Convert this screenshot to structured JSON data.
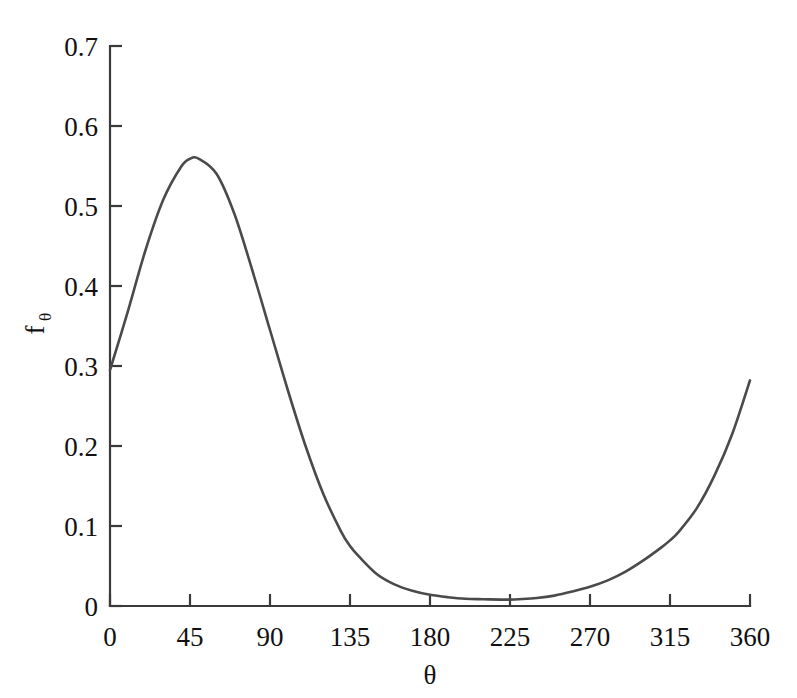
{
  "chart_data": {
    "type": "line",
    "title": "",
    "subtitle": "",
    "xlabel": "θ",
    "ylabel": "f",
    "ylabel_subscript": "θ",
    "xlim": [
      0,
      360
    ],
    "ylim": [
      0,
      0.7
    ],
    "xticks": [
      0,
      45,
      90,
      135,
      180,
      225,
      270,
      315,
      360
    ],
    "xtick_labels": [
      "0",
      "45",
      "90",
      "135",
      "180",
      "225",
      "270",
      "315",
      "360"
    ],
    "yticks": [
      0,
      0.1,
      0.2,
      0.3,
      0.4,
      0.5,
      0.6,
      0.7
    ],
    "ytick_labels": [
      "0",
      "0.1",
      "0.2",
      "0.3",
      "0.4",
      "0.5",
      "0.6",
      "0.7"
    ],
    "grid": false,
    "legend": null,
    "series": [
      {
        "name": "f_theta",
        "color": "#4a4a4a",
        "x": [
          0,
          10,
          20,
          30,
          40,
          45,
          50,
          60,
          70,
          80,
          90,
          100,
          110,
          120,
          130,
          135,
          140,
          150,
          160,
          170,
          180,
          190,
          200,
          210,
          220,
          225,
          230,
          240,
          250,
          260,
          270,
          280,
          290,
          300,
          310,
          315,
          320,
          330,
          340,
          350,
          360
        ],
        "values": [
          0.295,
          0.368,
          0.445,
          0.508,
          0.549,
          0.559,
          0.559,
          0.54,
          0.49,
          0.42,
          0.345,
          0.27,
          0.2,
          0.14,
          0.093,
          0.075,
          0.062,
          0.04,
          0.027,
          0.019,
          0.014,
          0.011,
          0.009,
          0.0085,
          0.008,
          0.008,
          0.0085,
          0.01,
          0.013,
          0.018,
          0.024,
          0.032,
          0.043,
          0.057,
          0.073,
          0.082,
          0.093,
          0.122,
          0.163,
          0.215,
          0.282
        ]
      }
    ],
    "annotations": []
  },
  "axes": {
    "x_axis_name": "theta-axis",
    "y_axis_name": "f-theta-axis"
  }
}
